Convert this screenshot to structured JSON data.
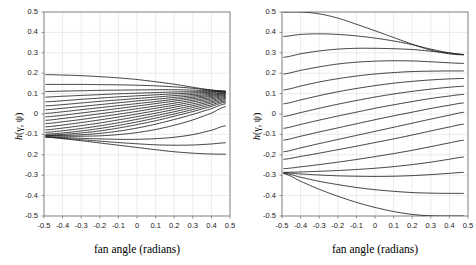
{
  "figure": {
    "background": "#ffffff",
    "line_color": "#1a1a1a",
    "frame_color": "#7a7a7a",
    "grid_color": "#d9d9d9"
  },
  "chart_data": [
    {
      "type": "line",
      "panel": "left",
      "title": "",
      "xlabel": "fan angle (radians)",
      "ylabel": "h(γ, ψ)",
      "xlim": [
        -0.5,
        0.5
      ],
      "ylim": [
        -0.5,
        0.5
      ],
      "xticks": [
        -0.5,
        -0.4,
        -0.3,
        -0.2,
        -0.1,
        0,
        0.1,
        0.2,
        0.3,
        0.4,
        0.5
      ],
      "xticklabels": [
        "-0.5",
        "-0.4",
        "-0.3",
        "-0.2",
        "-0.1",
        "0",
        "0.1",
        "0.2",
        "0.3",
        "0.4",
        "0.5"
      ],
      "yticks": [
        0.5,
        0.4,
        0.3,
        0.2,
        0.1,
        0,
        -0.1,
        -0.2,
        -0.3,
        -0.4,
        -0.5
      ],
      "yticklabels": [
        "0.5",
        "0.4",
        "0.3",
        "0.2",
        "0.1",
        "0",
        "-0.1",
        "0.2",
        "-0.3",
        "-0.4",
        "-0.5"
      ],
      "grid": true,
      "legend": "none",
      "x": [
        -0.49,
        -0.4,
        -0.3,
        -0.2,
        -0.1,
        0.0,
        0.1,
        0.2,
        0.3,
        0.4,
        0.475
      ],
      "series": [
        {
          "name": "psi-01",
          "values": [
            0.193,
            0.191,
            0.188,
            0.183,
            0.177,
            0.169,
            0.158,
            0.146,
            0.131,
            0.118,
            0.112
          ]
        },
        {
          "name": "psi-02",
          "values": [
            0.145,
            0.145,
            0.145,
            0.144,
            0.143,
            0.141,
            0.138,
            0.133,
            0.126,
            0.117,
            0.111
          ]
        },
        {
          "name": "psi-03",
          "values": [
            0.11,
            0.112,
            0.114,
            0.116,
            0.117,
            0.118,
            0.119,
            0.119,
            0.117,
            0.114,
            0.111
          ]
        },
        {
          "name": "psi-04",
          "values": [
            0.083,
            0.087,
            0.091,
            0.095,
            0.099,
            0.102,
            0.105,
            0.108,
            0.109,
            0.11,
            0.11
          ]
        },
        {
          "name": "psi-05",
          "values": [
            0.06,
            0.065,
            0.072,
            0.078,
            0.084,
            0.089,
            0.094,
            0.099,
            0.103,
            0.106,
            0.108
          ]
        },
        {
          "name": "psi-06",
          "values": [
            0.04,
            0.046,
            0.054,
            0.062,
            0.069,
            0.076,
            0.083,
            0.09,
            0.096,
            0.101,
            0.105
          ]
        },
        {
          "name": "psi-07",
          "values": [
            0.021,
            0.028,
            0.037,
            0.046,
            0.055,
            0.064,
            0.072,
            0.081,
            0.089,
            0.096,
            0.102
          ]
        },
        {
          "name": "psi-08",
          "values": [
            0.003,
            0.011,
            0.021,
            0.031,
            0.041,
            0.051,
            0.061,
            0.072,
            0.082,
            0.091,
            0.099
          ]
        },
        {
          "name": "psi-09",
          "values": [
            -0.014,
            -0.006,
            0.005,
            0.016,
            0.027,
            0.039,
            0.051,
            0.063,
            0.075,
            0.086,
            0.095
          ]
        },
        {
          "name": "psi-10",
          "values": [
            -0.031,
            -0.022,
            -0.011,
            0.001,
            0.013,
            0.026,
            0.039,
            0.053,
            0.067,
            0.08,
            0.091
          ]
        },
        {
          "name": "psi-11",
          "values": [
            -0.047,
            -0.038,
            -0.027,
            -0.014,
            -0.001,
            0.013,
            0.028,
            0.043,
            0.059,
            0.074,
            0.086
          ]
        },
        {
          "name": "psi-12",
          "values": [
            -0.063,
            -0.054,
            -0.042,
            -0.029,
            -0.015,
            0.0,
            0.016,
            0.033,
            0.05,
            0.067,
            0.081
          ]
        },
        {
          "name": "psi-13",
          "values": [
            -0.078,
            -0.069,
            -0.057,
            -0.044,
            -0.029,
            -0.013,
            0.004,
            0.022,
            0.041,
            0.06,
            0.076
          ]
        },
        {
          "name": "psi-14",
          "values": [
            -0.09,
            -0.082,
            -0.071,
            -0.058,
            -0.043,
            -0.026,
            -0.008,
            0.011,
            0.032,
            0.053,
            0.07
          ]
        },
        {
          "name": "psi-15",
          "values": [
            -0.099,
            -0.093,
            -0.083,
            -0.071,
            -0.056,
            -0.039,
            -0.02,
            0.0,
            0.022,
            0.045,
            0.064
          ]
        },
        {
          "name": "psi-16",
          "values": [
            -0.104,
            -0.1,
            -0.093,
            -0.083,
            -0.069,
            -0.052,
            -0.033,
            -0.011,
            0.012,
            0.037,
            0.058
          ]
        },
        {
          "name": "psi-17",
          "values": [
            -0.106,
            -0.105,
            -0.102,
            -0.095,
            -0.084,
            -0.069,
            -0.05,
            -0.027,
            -0.002,
            0.026,
            0.05
          ]
        },
        {
          "name": "psi-18",
          "values": [
            -0.108,
            -0.109,
            -0.109,
            -0.107,
            -0.101,
            -0.091,
            -0.076,
            -0.055,
            -0.029,
            0.004,
            0.036
          ]
        },
        {
          "name": "psi-19",
          "values": [
            -0.112,
            -0.115,
            -0.119,
            -0.122,
            -0.124,
            -0.124,
            -0.121,
            -0.114,
            -0.101,
            -0.08,
            -0.058
          ]
        },
        {
          "name": "psi-20",
          "values": [
            -0.113,
            -0.119,
            -0.126,
            -0.133,
            -0.14,
            -0.146,
            -0.151,
            -0.153,
            -0.152,
            -0.147,
            -0.141
          ]
        },
        {
          "name": "psi-21",
          "values": [
            -0.113,
            -0.121,
            -0.131,
            -0.142,
            -0.153,
            -0.164,
            -0.175,
            -0.185,
            -0.192,
            -0.196,
            -0.197
          ]
        }
      ]
    },
    {
      "type": "line",
      "panel": "right",
      "title": "",
      "xlabel": "fan angle (radians)",
      "ylabel": "h(γ, ψ)",
      "xlim": [
        -0.5,
        0.5
      ],
      "ylim": [
        -0.5,
        0.5
      ],
      "xticks": [
        -0.5,
        -0.4,
        -0.3,
        -0.2,
        -0.1,
        0,
        0.1,
        0.2,
        0.3,
        0.4,
        0.5
      ],
      "xticklabels": [
        "-0.5",
        "-0.4",
        "-0.3",
        "-0.2",
        "-0.1",
        "0",
        "0.1",
        "0.2",
        "0.3",
        "0.4",
        "0.5"
      ],
      "yticks": [
        0.5,
        0.4,
        0.3,
        0.2,
        0.1,
        0,
        -0.1,
        -0.2,
        -0.3,
        -0.4,
        -0.5
      ],
      "yticklabels": [
        "0.5",
        "0.4",
        "0.3",
        "0.2",
        "0.1",
        "0",
        "-0.1",
        "-0.2",
        "-0.3",
        "-0.4",
        "-0.5"
      ],
      "grid": true,
      "legend": "none",
      "x": [
        -0.49,
        -0.4,
        -0.3,
        -0.2,
        -0.1,
        0.0,
        0.1,
        0.2,
        0.3,
        0.4,
        0.475
      ],
      "series": [
        {
          "name": "psi-01",
          "values": [
            0.5,
            0.5,
            0.491,
            0.47,
            0.44,
            0.408,
            0.375,
            0.342,
            0.313,
            0.295,
            0.29
          ]
        },
        {
          "name": "psi-02",
          "values": [
            0.38,
            0.39,
            0.393,
            0.39,
            0.383,
            0.372,
            0.358,
            0.34,
            0.318,
            0.3,
            0.291
          ]
        },
        {
          "name": "psi-03",
          "values": [
            0.278,
            0.295,
            0.309,
            0.318,
            0.322,
            0.322,
            0.32,
            0.316,
            0.308,
            0.299,
            0.292
          ]
        },
        {
          "name": "psi-04",
          "values": [
            0.196,
            0.214,
            0.231,
            0.245,
            0.254,
            0.259,
            0.261,
            0.26,
            0.256,
            0.251,
            0.248
          ]
        },
        {
          "name": "psi-05",
          "values": [
            0.118,
            0.137,
            0.157,
            0.173,
            0.186,
            0.196,
            0.203,
            0.208,
            0.21,
            0.211,
            0.211
          ]
        },
        {
          "name": "psi-06",
          "values": [
            0.05,
            0.069,
            0.09,
            0.109,
            0.125,
            0.139,
            0.151,
            0.16,
            0.167,
            0.172,
            0.174
          ]
        },
        {
          "name": "psi-07",
          "values": [
            -0.012,
            0.007,
            0.028,
            0.048,
            0.066,
            0.083,
            0.098,
            0.111,
            0.122,
            0.131,
            0.136
          ]
        },
        {
          "name": "psi-08",
          "values": [
            -0.07,
            -0.051,
            -0.03,
            -0.01,
            0.009,
            0.028,
            0.045,
            0.061,
            0.076,
            0.088,
            0.096
          ]
        },
        {
          "name": "psi-09",
          "values": [
            -0.128,
            -0.109,
            -0.088,
            -0.068,
            -0.048,
            -0.028,
            -0.009,
            0.009,
            0.027,
            0.043,
            0.054
          ]
        },
        {
          "name": "psi-10",
          "values": [
            -0.185,
            -0.166,
            -0.145,
            -0.125,
            -0.105,
            -0.085,
            -0.065,
            -0.045,
            -0.025,
            -0.006,
            0.008
          ]
        },
        {
          "name": "psi-11",
          "values": [
            -0.222,
            -0.208,
            -0.192,
            -0.175,
            -0.158,
            -0.14,
            -0.122,
            -0.103,
            -0.083,
            -0.064,
            -0.05
          ]
        },
        {
          "name": "psi-12",
          "values": [
            -0.268,
            -0.259,
            -0.248,
            -0.236,
            -0.223,
            -0.209,
            -0.194,
            -0.178,
            -0.16,
            -0.142,
            -0.129
          ]
        },
        {
          "name": "psi-13",
          "values": [
            -0.286,
            -0.284,
            -0.281,
            -0.277,
            -0.272,
            -0.266,
            -0.258,
            -0.248,
            -0.236,
            -0.222,
            -0.211
          ]
        },
        {
          "name": "psi-14",
          "values": [
            -0.288,
            -0.294,
            -0.299,
            -0.303,
            -0.305,
            -0.306,
            -0.305,
            -0.302,
            -0.297,
            -0.291,
            -0.286
          ]
        },
        {
          "name": "psi-15",
          "values": [
            -0.29,
            -0.31,
            -0.33,
            -0.346,
            -0.36,
            -0.371,
            -0.379,
            -0.385,
            -0.388,
            -0.389,
            -0.389
          ]
        },
        {
          "name": "psi-16",
          "values": [
            -0.292,
            -0.33,
            -0.369,
            -0.403,
            -0.433,
            -0.458,
            -0.478,
            -0.492,
            -0.499,
            -0.5,
            -0.5
          ]
        }
      ]
    }
  ]
}
